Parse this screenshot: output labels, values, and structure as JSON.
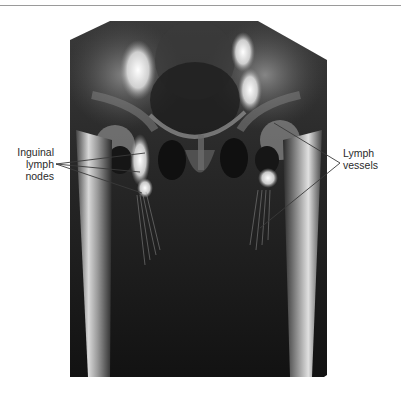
{
  "figure": {
    "type": "radiograph",
    "colors": {
      "background": "#ffffff",
      "film_dark": "#141414",
      "bone_light": "#d8d8d8",
      "contrast_bright": "#f2f2f2",
      "leader_line": "#3a3a3a",
      "label_text": "#2a2a2a",
      "top_rule": "#9a9a9a"
    },
    "labels": {
      "left": {
        "lines": [
          "Inguinal",
          "lymph",
          "nodes"
        ],
        "leader_origin": [
          56,
          164
        ],
        "leader_targets": [
          [
            145,
            153
          ],
          [
            140,
            172
          ],
          [
            142,
            193
          ]
        ]
      },
      "right": {
        "lines": [
          "Lymph",
          "vessels"
        ],
        "leader_origin": [
          340,
          163
        ],
        "leader_targets": [
          [
            274,
            123
          ],
          [
            260,
            228
          ]
        ]
      }
    }
  }
}
